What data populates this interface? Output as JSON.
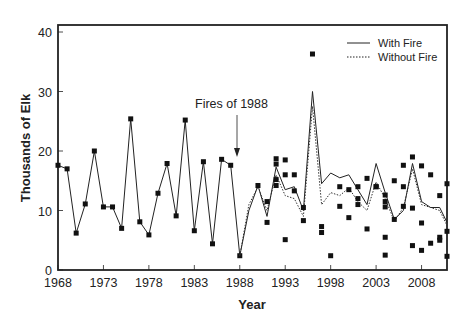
{
  "chart_data": {
    "type": "line",
    "title": "",
    "xlabel": "Year",
    "ylabel": "Thousands of Elk",
    "xlim": [
      1968,
      2010.8
    ],
    "ylim": [
      0,
      40
    ],
    "x_ticks": [
      1968,
      1973,
      1978,
      1983,
      1988,
      1993,
      1998,
      2003,
      2008
    ],
    "y_ticks": [
      0,
      10,
      20,
      30,
      40
    ],
    "grid": false,
    "legend_position": "top-right",
    "annotations": [
      {
        "text": "Fires of 1988",
        "x": 1988,
        "arrow_from_y": 27.5,
        "arrow_to_y": 19
      }
    ],
    "series": [
      {
        "name": "Observed (pre-1988)",
        "style": "solid-line-with-square-markers",
        "x": [
          1968,
          1969,
          1970,
          1971,
          1972,
          1973,
          1974,
          1975,
          1976,
          1977,
          1978,
          1979,
          1980,
          1981,
          1982,
          1983,
          1984,
          1985,
          1986,
          1987,
          1988
        ],
        "values": [
          17.6,
          17.0,
          6.2,
          11.1,
          20.0,
          10.6,
          10.6,
          7.0,
          25.4,
          8.1,
          5.9,
          12.9,
          17.9,
          9.1,
          25.2,
          6.6,
          18.2,
          4.4,
          18.6,
          17.6,
          2.4
        ]
      },
      {
        "name": "With Fire",
        "style": "solid",
        "x": [
          1988,
          1989,
          1990,
          1991,
          1992,
          1993,
          1994,
          1995,
          1996,
          1997,
          1998,
          1999,
          2000,
          2001,
          2002,
          2003,
          2004,
          2005,
          2006,
          2007,
          2008,
          2009,
          2010,
          2010.8
        ],
        "values": [
          2.4,
          10.0,
          14.2,
          9.0,
          17.3,
          13.5,
          14.0,
          10.0,
          30.0,
          14.5,
          16.3,
          15.5,
          16.0,
          13.5,
          11.0,
          17.9,
          13.0,
          8.5,
          10.0,
          17.9,
          11.5,
          10.5,
          10.5,
          8.0
        ]
      },
      {
        "name": "Without Fire",
        "style": "dotted",
        "x": [
          1988,
          1989,
          1990,
          1991,
          1992,
          1993,
          1994,
          1995,
          1996,
          1997,
          1998,
          1999,
          2000,
          2001,
          2002,
          2003,
          2004,
          2005,
          2006,
          2007,
          2008,
          2009,
          2010,
          2010.8
        ],
        "values": [
          2.4,
          11.0,
          14.0,
          10.0,
          16.0,
          12.5,
          12.0,
          9.0,
          27.5,
          11.0,
          13.0,
          12.5,
          13.8,
          11.5,
          10.0,
          14.8,
          12.0,
          8.2,
          10.5,
          17.0,
          11.0,
          10.5,
          10.0,
          7.5
        ]
      },
      {
        "name": "Observed counts (post-1988)",
        "style": "square-markers",
        "points": [
          [
            1990,
            14.2
          ],
          [
            1991,
            11.5
          ],
          [
            1991,
            8.0
          ],
          [
            1992,
            18.7
          ],
          [
            1992,
            17.8
          ],
          [
            1992,
            15.2
          ],
          [
            1992,
            14.2
          ],
          [
            1993,
            18.5
          ],
          [
            1993,
            5.1
          ],
          [
            1993,
            16.0
          ],
          [
            1994,
            13.3
          ],
          [
            1994,
            16.0
          ],
          [
            1995,
            10.5
          ],
          [
            1995,
            8.3
          ],
          [
            1996,
            36.3
          ],
          [
            1997,
            7.3
          ],
          [
            1997,
            6.3
          ],
          [
            1998,
            2.4
          ],
          [
            1999,
            14.0
          ],
          [
            1999,
            10.7
          ],
          [
            2000,
            13.5
          ],
          [
            2000,
            8.8
          ],
          [
            2001,
            12.0
          ],
          [
            2001,
            11.0
          ],
          [
            2001,
            14.0
          ],
          [
            2002,
            15.4
          ],
          [
            2002,
            6.9
          ],
          [
            2003,
            14.0
          ],
          [
            2003,
            14.0
          ],
          [
            2004,
            11.5
          ],
          [
            2004,
            5.5
          ],
          [
            2004,
            2.5
          ],
          [
            2004,
            12.6
          ],
          [
            2004,
            10.6
          ],
          [
            2005,
            15.0
          ],
          [
            2005,
            8.5
          ],
          [
            2006,
            17.6
          ],
          [
            2006,
            14.0
          ],
          [
            2006,
            10.7
          ],
          [
            2007,
            19.0
          ],
          [
            2007,
            10.4
          ],
          [
            2007,
            4.1
          ],
          [
            2008,
            17.5
          ],
          [
            2008,
            7.9
          ],
          [
            2008,
            3.3
          ],
          [
            2009,
            16.0
          ],
          [
            2009,
            4.5
          ],
          [
            2010,
            12.5
          ],
          [
            2010,
            5.5
          ],
          [
            2010,
            5.0
          ],
          [
            2010.8,
            14.5
          ],
          [
            2010.8,
            6.5
          ],
          [
            2010.8,
            2.3
          ]
        ]
      }
    ]
  },
  "labels": {
    "xlabel": "Year",
    "ylabel": "Thousands of Elk",
    "annotation": "Fires of 1988",
    "legend_with_fire": "With Fire",
    "legend_without_fire": "Without Fire",
    "x_ticks": [
      "1968",
      "1973",
      "1978",
      "1983",
      "1988",
      "1993",
      "1998",
      "2003",
      "2008"
    ],
    "y_ticks": [
      "0",
      "10",
      "20",
      "30",
      "40"
    ]
  }
}
